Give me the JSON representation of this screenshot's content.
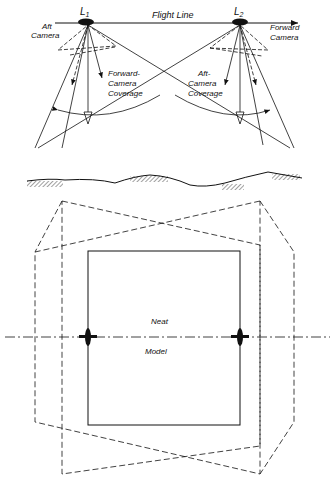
{
  "diagram": {
    "type": "convergent stereo photography geometry",
    "top_view": {
      "flight_line_label": "Flight Line",
      "station_1_label": "L",
      "station_1_sub": "1",
      "station_2_label": "L",
      "station_2_sub": "2",
      "aft_camera_label_line1": "Aft",
      "aft_camera_label_line2": "Camera",
      "forward_camera_label_line1": "Forward",
      "forward_camera_label_line2": "Camera",
      "forward_coverage_line1": "Forward-",
      "forward_coverage_line2": "Camera",
      "forward_coverage_line3": "Coverage",
      "aft_coverage_line1": "Aft-",
      "aft_coverage_line2": "Camera",
      "aft_coverage_line3": "Coverage"
    },
    "plan_view": {
      "neat_label": "Neat",
      "model_label": "Model"
    },
    "colors": {
      "ink": "#111111",
      "background": "#ffffff"
    }
  }
}
